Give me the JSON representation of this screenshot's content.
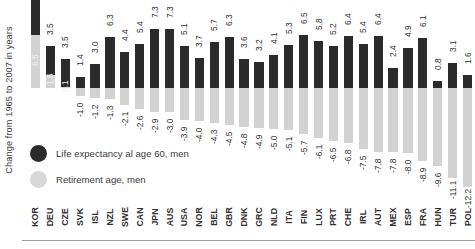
{
  "axis": {
    "y_title": "Change from 1965 to 2007 in years"
  },
  "legend": {
    "items": [
      {
        "label": "Life expectancy al age 60, men",
        "color": "#2b2b2b",
        "marker": "circle-dark"
      },
      {
        "label": "Retirement age, men",
        "color": "#d8d8d8",
        "marker": "circle-light"
      }
    ]
  },
  "chart_data": {
    "type": "bar",
    "subtype": "diverging-stacked",
    "title": "",
    "xlabel": "",
    "ylabel": "Change from 1965 to 2007 in years",
    "ylim": [
      -13.0,
      8.5
    ],
    "zero_baseline": 0,
    "grid": false,
    "legend_position": "inside-left",
    "categories": [
      "KOR",
      "DEU",
      "CZE",
      "SVK",
      "ISL",
      "NZL",
      "SWE",
      "CAN",
      "JPN",
      "AUS",
      "USA",
      "NOR",
      "BEL",
      "GBR",
      "DNK",
      "GRC",
      "NLD",
      "ITA",
      "FIN",
      "LUX",
      "PRT",
      "CHE",
      "IRL",
      "AUT",
      "MEX",
      "ESP",
      "FRA",
      "HUN",
      "TUR",
      "POL"
    ],
    "series": [
      {
        "name": "Life expectancy al age 60, men",
        "color": "#2b2b2b",
        "values": [
          7.5,
          3.5,
          3.5,
          1.4,
          3.0,
          6.3,
          4.4,
          5.4,
          7.3,
          7.3,
          5.1,
          3.7,
          5.7,
          6.3,
          3.6,
          3.2,
          4.1,
          5.3,
          6.5,
          5.8,
          5.2,
          6.4,
          5.4,
          6.4,
          2.4,
          4.9,
          6.1,
          0.8,
          3.1,
          1.6
        ],
        "labels": [
          "7.5",
          "3.5",
          "3.5",
          "1.4",
          "3.0",
          "6.3",
          "4.4",
          "5.4",
          "7.3",
          "7.3",
          "5.1",
          "3.7",
          "5.7",
          "6.3",
          "3.6",
          "3.2",
          "4.1",
          "5.3",
          "6.5",
          "5.8",
          "5.2",
          "6.4",
          "5.4",
          "6.4",
          "2.4",
          "4.9",
          "6.1",
          "0.8",
          "3.1",
          "1.6"
        ]
      },
      {
        "name": "Retirement age, men",
        "color": "#d2d2d2",
        "values": [
          6.5,
          1.6,
          0.1,
          -1.0,
          -1.2,
          -1.3,
          -2.1,
          -2.6,
          -2.9,
          -3.0,
          -3.9,
          -4.0,
          -4.3,
          -4.5,
          -4.8,
          -4.9,
          -5.0,
          -5.1,
          -5.7,
          -6.1,
          -6.5,
          -6.8,
          -7.5,
          -7.8,
          -7.8,
          -8.0,
          -8.9,
          -9.6,
          -11.1,
          -12.2
        ],
        "labels": [
          "6.5",
          "1.6",
          "0.1",
          "-1.0",
          "-1.2",
          "-1.3",
          "-2.1",
          "-2.6",
          "-2.9",
          "-3.0",
          "-3.9",
          "-4.0",
          "-4.3",
          "-4.5",
          "-4.8",
          "-4.9",
          "-5.0",
          "-5.1",
          "-5.7",
          "-6.1",
          "-6.5",
          "-6.8",
          "-7.5",
          "-7.8",
          "-7.8",
          "-8.0",
          "-8.9",
          "-9.6",
          "-11.1",
          "-12.2"
        ]
      }
    ]
  }
}
